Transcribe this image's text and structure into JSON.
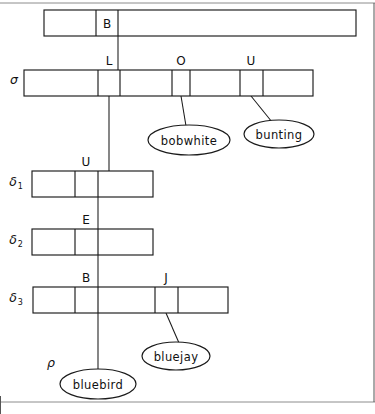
{
  "figure": {
    "background_color": "#ffffff",
    "line_color": "#1a1a1a"
  },
  "rows": [
    {
      "id": "row-top",
      "label": "",
      "x": 44,
      "y": 10,
      "width": 312,
      "height": 26,
      "dividers": [
        96,
        118
      ],
      "cells": [
        {
          "label": "",
          "center_x": 70
        },
        {
          "label": "B",
          "center_x": 107
        },
        {
          "label": "",
          "center_x": 237
        }
      ]
    },
    {
      "id": "row-sigma",
      "label": "σ",
      "label_x": 14,
      "label_y": 84,
      "x": 24,
      "y": 70,
      "width": 289,
      "height": 26,
      "dividers": [
        98,
        120,
        172,
        190,
        240,
        263
      ],
      "cells": [
        {
          "label": "",
          "center_x": 61
        },
        {
          "label": "L",
          "center_x": 109,
          "label_above": true
        },
        {
          "label": "",
          "center_x": 146
        },
        {
          "label": "O",
          "center_x": 181,
          "label_above": true
        },
        {
          "label": "",
          "center_x": 215
        },
        {
          "label": "U",
          "center_x": 251,
          "label_above": true
        },
        {
          "label": "",
          "center_x": 288
        }
      ]
    },
    {
      "id": "row-delta1",
      "label": "δ",
      "label_sub": "1",
      "label_x": 16,
      "label_y": 185,
      "x": 32,
      "y": 171,
      "width": 121,
      "height": 26,
      "dividers": [
        75,
        98
      ],
      "cells": [
        {
          "label": "",
          "center_x": 53
        },
        {
          "label": "U",
          "center_x": 86,
          "label_above": true
        },
        {
          "label": "",
          "center_x": 125
        }
      ]
    },
    {
      "id": "row-delta2",
      "label": "δ",
      "label_sub": "2",
      "label_x": 16,
      "label_y": 243,
      "x": 32,
      "y": 229,
      "width": 121,
      "height": 26,
      "dividers": [
        75,
        98
      ],
      "cells": [
        {
          "label": "",
          "center_x": 53
        },
        {
          "label": "E",
          "center_x": 86,
          "label_above": true
        },
        {
          "label": "",
          "center_x": 125
        }
      ]
    },
    {
      "id": "row-delta3",
      "label": "δ",
      "label_sub": "3",
      "label_x": 16,
      "label_y": 301,
      "x": 33,
      "y": 287,
      "width": 195,
      "height": 26,
      "dividers": [
        75,
        98,
        155,
        178
      ],
      "cells": [
        {
          "label": "",
          "center_x": 54
        },
        {
          "label": "B",
          "center_x": 86,
          "label_above": true
        },
        {
          "label": "",
          "center_x": 126
        },
        {
          "label": "J",
          "center_x": 166,
          "label_above": true
        },
        {
          "label": "",
          "center_x": 203
        }
      ]
    }
  ],
  "nodes": [
    {
      "id": "node-bobwhite",
      "label": "bobwhite",
      "cx": 189,
      "cy": 140,
      "rx": 41,
      "ry": 15
    },
    {
      "id": "node-bunting",
      "label": "bunting",
      "cx": 279,
      "cy": 134,
      "rx": 35,
      "ry": 14
    },
    {
      "id": "node-bluejay",
      "label": "bluejay",
      "cx": 176,
      "cy": 356,
      "rx": 34,
      "ry": 14
    },
    {
      "id": "node-bluebird",
      "label": "bluebird",
      "cx": 98,
      "cy": 384,
      "rx": 38,
      "ry": 15
    }
  ],
  "edges": [
    {
      "id": "edge-top-to-sigma",
      "from": "row-top.B",
      "to": "row-sigma.L",
      "x1": 118,
      "y1": 36,
      "x2": 118,
      "y2": 70
    },
    {
      "id": "edge-sigma-L-to-delta1",
      "from": "row-sigma.L",
      "to": "row-delta1.U",
      "x1": 109,
      "y1": 96,
      "x2": 109,
      "y2": 171
    },
    {
      "id": "edge-sigma-O-to-bobwhite",
      "from": "row-sigma.O",
      "to": "node-bobwhite",
      "x1": 181,
      "y1": 96,
      "x2": 186,
      "y2": 125
    },
    {
      "id": "edge-sigma-U-to-bunting",
      "from": "row-sigma.U",
      "to": "node-bunting",
      "x1": 251,
      "y1": 96,
      "x2": 271,
      "y2": 121
    },
    {
      "id": "edge-delta1-to-delta2",
      "from": "row-delta1.U",
      "to": "row-delta2.E",
      "x1": 98,
      "y1": 197,
      "x2": 98,
      "y2": 229
    },
    {
      "id": "edge-delta2-to-delta3",
      "from": "row-delta2.E",
      "to": "row-delta3.B",
      "x1": 98,
      "y1": 255,
      "x2": 98,
      "y2": 287
    },
    {
      "id": "edge-delta3-B-to-bluebird",
      "from": "row-delta3.B",
      "to": "node-bluebird",
      "x1": 98,
      "y1": 313,
      "x2": 98,
      "y2": 369
    },
    {
      "id": "edge-delta3-J-to-bluejay",
      "from": "row-delta3.J",
      "to": "node-bluejay",
      "x1": 166,
      "y1": 313,
      "x2": 178,
      "y2": 342
    }
  ],
  "annotations": [
    {
      "id": "rho-label",
      "text": "ρ",
      "x": 51,
      "y": 366
    }
  ],
  "frame": {
    "top_rule_y": 3,
    "bottom_rule_y": 402,
    "right_edge_x": 374,
    "left_edge_x": 0
  }
}
